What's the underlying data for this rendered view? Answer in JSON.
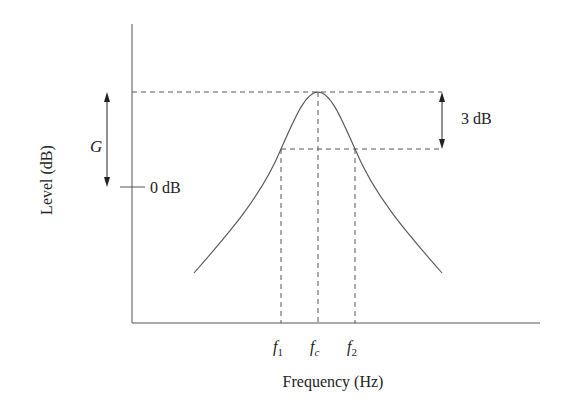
{
  "diagram": {
    "type": "bandpass filter frequency response",
    "xlabel": "Frequency (Hz)",
    "ylabel": "Level (dB)",
    "annotations": {
      "gain_label": "G",
      "zero_db_label": "0 dB",
      "bandwidth_drop_label": "3 dB"
    },
    "x_ticks": {
      "f1": {
        "base": "f",
        "sub": "1"
      },
      "fc": {
        "base": "f",
        "sub": "c"
      },
      "f2": {
        "base": "f",
        "sub": "2"
      }
    },
    "colors": {
      "line": "#555555",
      "text": "#222222",
      "background": "#ffffff"
    }
  }
}
